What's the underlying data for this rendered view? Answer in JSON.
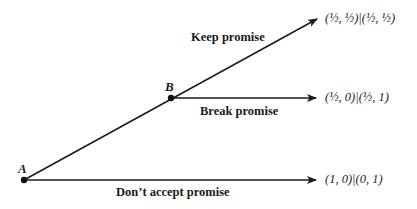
{
  "diagram": {
    "type": "game-tree",
    "nodes": [
      {
        "id": "A",
        "label": "A"
      },
      {
        "id": "B",
        "label": "B"
      }
    ],
    "edges": [
      {
        "from": "A",
        "to": "B",
        "label": "Keep promise",
        "continues": true
      },
      {
        "from": "B",
        "label": "Keep promise",
        "payoff": "(½, ½)|(½, ½)"
      },
      {
        "from": "B",
        "label": "Break promise",
        "payoff": "(½, 0)|(½, 1)"
      },
      {
        "from": "A",
        "label": "Don’t accept promise",
        "payoff": "(1, 0)|(0, 1)"
      }
    ],
    "labels": {
      "keep": "Keep promise",
      "break": "Break promise",
      "dont_accept": "Don’t accept promise"
    },
    "payoffs": {
      "keep": "(½, ½)|(½, ½)",
      "break": "(½, 0)|(½, 1)",
      "dont_accept": "(1, 0)|(0, 1)"
    },
    "node_labels": {
      "a": "A",
      "b": "B"
    }
  }
}
